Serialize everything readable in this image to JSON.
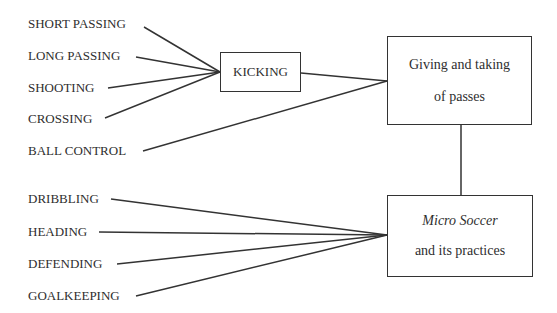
{
  "diagram": {
    "skills_group_1": [
      {
        "label": "SHORT PASSING"
      },
      {
        "label": "LONG PASSING"
      },
      {
        "label": "SHOOTING"
      },
      {
        "label": "CROSSING"
      }
    ],
    "skill_ball_control": {
      "label": "BALL CONTROL"
    },
    "skills_group_2": [
      {
        "label": "DRIBBLING"
      },
      {
        "label": "HEADING"
      },
      {
        "label": "DEFENDING"
      },
      {
        "label": "GOALKEEPING"
      }
    ],
    "kicking_box": {
      "label": "KICKING"
    },
    "passes_box": {
      "line1": "Giving and taking",
      "line2": "of passes"
    },
    "micro_box": {
      "line1": "Micro Soccer",
      "line2": "and its practices"
    },
    "connections": [
      {
        "from": "SHORT PASSING",
        "to": "KICKING"
      },
      {
        "from": "LONG PASSING",
        "to": "KICKING"
      },
      {
        "from": "SHOOTING",
        "to": "KICKING"
      },
      {
        "from": "CROSSING",
        "to": "KICKING"
      },
      {
        "from": "KICKING",
        "to": "Giving and taking of passes"
      },
      {
        "from": "BALL CONTROL",
        "to": "Giving and taking of passes"
      },
      {
        "from": "Giving and taking of passes",
        "to": "Micro Soccer and its practices"
      },
      {
        "from": "DRIBBLING",
        "to": "Micro Soccer and its practices"
      },
      {
        "from": "HEADING",
        "to": "Micro Soccer and its practices"
      },
      {
        "from": "DEFENDING",
        "to": "Micro Soccer and its practices"
      },
      {
        "from": "GOALKEEPING",
        "to": "Micro Soccer and its practices"
      }
    ],
    "colors": {
      "line": "#333333",
      "text": "#2e2e2e",
      "background": "#ffffff"
    }
  }
}
